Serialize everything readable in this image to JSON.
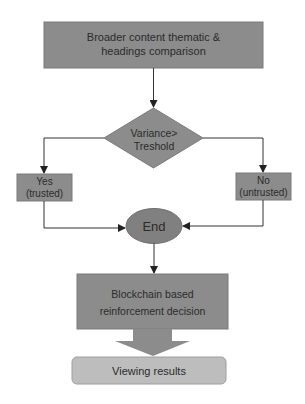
{
  "diagram": {
    "type": "flowchart",
    "nodes": {
      "start_box": {
        "line1": "Broader content thematic &",
        "line2": "headings comparison",
        "shape": "rectangle"
      },
      "decision": {
        "line1": "Variance>",
        "line2": "Treshold",
        "shape": "diamond"
      },
      "yes_box": {
        "line1": "Yes",
        "line2": "(trusted)",
        "shape": "rectangle"
      },
      "no_box": {
        "line1": "No",
        "line2": "(untrusted)",
        "shape": "rectangle"
      },
      "end": {
        "label": "End",
        "shape": "ellipse"
      },
      "blockchain_box": {
        "line1": "Blockchain based",
        "line2": "reinforcement decision",
        "shape": "rectangle"
      },
      "viewing_results": {
        "label": "Viewing results",
        "shape": "rounded-rectangle"
      }
    },
    "edges": [
      {
        "from": "start_box",
        "to": "decision"
      },
      {
        "from": "decision",
        "to": "yes_box"
      },
      {
        "from": "decision",
        "to": "no_box"
      },
      {
        "from": "yes_box",
        "to": "end"
      },
      {
        "from": "no_box",
        "to": "end"
      },
      {
        "from": "end",
        "to": "blockchain_box"
      },
      {
        "from": "blockchain_box",
        "to": "viewing_results",
        "style": "block-arrow"
      }
    ],
    "colors": {
      "box_fill": "#8c8c8c",
      "box_stroke": "#7a7a7a",
      "result_fill": "#bdbdbd",
      "line": "#333333",
      "text": "#2b2b2b"
    }
  }
}
